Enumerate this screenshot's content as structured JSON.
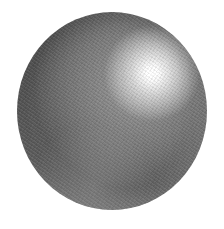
{
  "image": {
    "subject": "graphite pencil drawing of a shaded sphere",
    "background_color": "#ffffff",
    "sphere": {
      "left": 17,
      "top": 12,
      "width": 190,
      "height": 198,
      "highlight_position": "upper-right",
      "highlight_color": "#ffffff",
      "midtone_color": "#7c7c7c",
      "shadow_color": "#5e5e5e"
    }
  }
}
